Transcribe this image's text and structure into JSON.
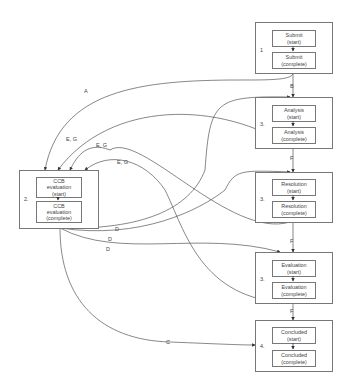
{
  "diagram": {
    "type": "state-transition workflow",
    "stages": [
      {
        "id": "submit",
        "number": "1",
        "start": "Submit\n(start)",
        "start_l1": "Submit",
        "start_l2": "(start)",
        "complete_l1": "Submit",
        "complete_l2": "(complete)"
      },
      {
        "id": "analysis",
        "number": "3.",
        "start_l1": "Analysis",
        "start_l2": "(start)",
        "complete_l1": "Analysis",
        "complete_l2": "(complete)",
        "self_loop": "H"
      },
      {
        "id": "resolution",
        "number": "3.",
        "start_l1": "Resolution",
        "start_l2": "(start)",
        "complete_l1": "Resolution",
        "complete_l2": "(complete)",
        "self_loop": "H"
      },
      {
        "id": "evaluation",
        "number": "3.",
        "start_l1": "Evaluation",
        "start_l2": "(start)",
        "complete_l1": "Evaluation",
        "complete_l2": "(complete)",
        "self_loop": "H"
      },
      {
        "id": "concluded",
        "number": "4.",
        "start_l1": "Concluded",
        "start_l2": "(start)",
        "complete_l1": "Concluded",
        "complete_l2": "(complete)"
      }
    ],
    "ccb": {
      "number": "2.",
      "start_l1": "CCB",
      "start_l2": "evaluation",
      "start_l3": "(start)",
      "complete_l1": "CCB",
      "complete_l2": "evaluation",
      "complete_l3": "(complete)"
    },
    "edge_labels": {
      "a": "A",
      "b": "B",
      "c": "C",
      "d1": "D",
      "d2": "D",
      "d3": "D",
      "eg1": "E, G",
      "eg2": "E, G",
      "eg3": "E, G",
      "f1": "F",
      "f2": "F",
      "f3": "F",
      "h1": "H",
      "h2": "H",
      "h3": "H"
    }
  }
}
